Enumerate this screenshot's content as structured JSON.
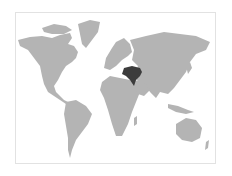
{
  "map": {
    "type": "world-locator-map",
    "highlighted_region": "Turkey / Middle East region",
    "colors": {
      "land": "#b4b4b4",
      "highlight": "#3c3c3c",
      "water": "#ffffff",
      "frame_border": "#e2e2e2"
    }
  }
}
